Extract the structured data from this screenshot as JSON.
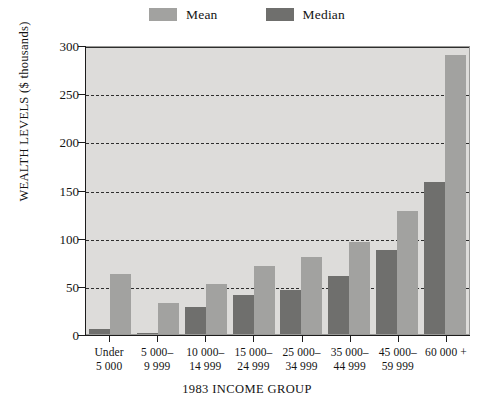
{
  "chart_data": {
    "type": "bar",
    "title": "",
    "xlabel": "1983 INCOME GROUP",
    "ylabel": "WEALTH LEVELS ($ thousands)",
    "ylim": [
      0,
      300
    ],
    "ytick_step": 50,
    "yticks": [
      0,
      50,
      100,
      150,
      200,
      250,
      300
    ],
    "ytick_labels": [
      "0",
      "50",
      "100",
      "150",
      "200",
      "250",
      "300"
    ],
    "grid": "horizontal-dashed",
    "legend_position": "top-center",
    "categories": [
      "Under\n5 000",
      "5 000–\n9 999",
      "10 000–\n14 999",
      "15 000–\n24 999",
      "25 000–\n34 999",
      "35 000–\n44 999",
      "45 000–\n59 999",
      "60 000 +"
    ],
    "series": [
      {
        "name": "Median",
        "color": "#6f6f6d",
        "values": [
          5,
          1,
          28,
          40,
          46,
          60,
          87,
          158
        ]
      },
      {
        "name": "Mean",
        "color": "#a2a2a0",
        "values": [
          62,
          32,
          52,
          71,
          80,
          96,
          128,
          290
        ]
      }
    ]
  },
  "legend": {
    "items": [
      {
        "label": "Mean",
        "color": "#a2a2a0"
      },
      {
        "label": "Median",
        "color": "#6f6f6d"
      }
    ]
  },
  "axes": {
    "y_title": "WEALTH LEVELS ($ thousands)",
    "x_title": "1983 INCOME GROUP"
  }
}
